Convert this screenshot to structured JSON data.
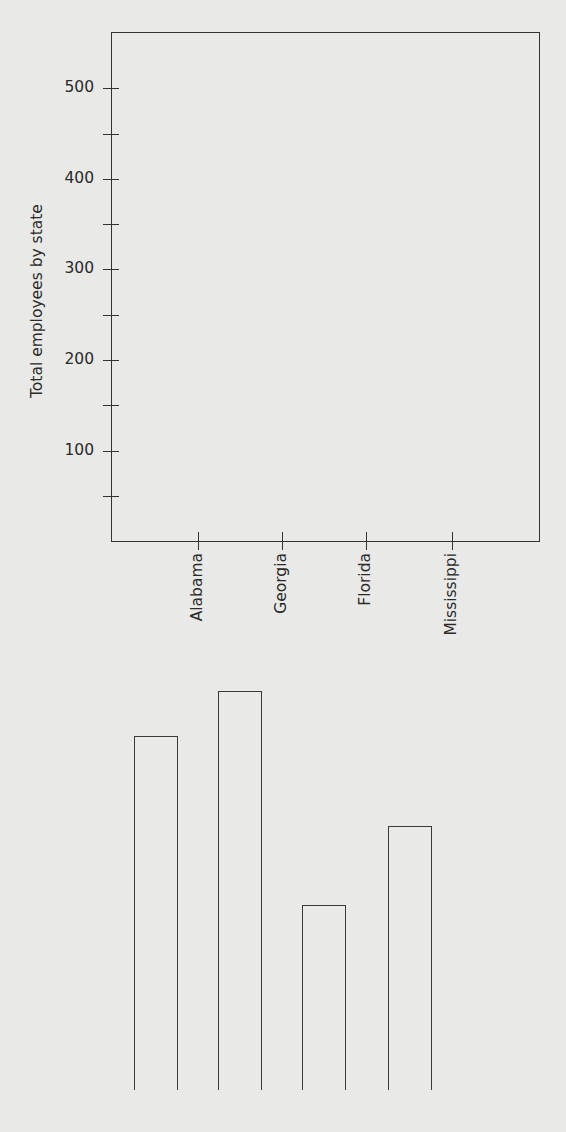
{
  "chart": {
    "ylabel": "Total employees by state",
    "yticks": [
      {
        "label": "500",
        "y": 88
      },
      {
        "label": "",
        "y": 134
      },
      {
        "label": "400",
        "y": 179
      },
      {
        "label": "",
        "y": 224
      },
      {
        "label": "300",
        "y": 269
      },
      {
        "label": "",
        "y": 315
      },
      {
        "label": "200",
        "y": 360
      },
      {
        "label": "",
        "y": 405
      },
      {
        "label": "100",
        "y": 451
      },
      {
        "label": "",
        "y": 496
      }
    ],
    "xticks": [
      {
        "label": "Alabama",
        "x": 198
      },
      {
        "label": "Georgia",
        "x": 282
      },
      {
        "label": "Florida",
        "x": 366
      },
      {
        "label": "Mississippi",
        "x": 452
      }
    ],
    "cutout_bars": [
      {
        "state": "Alabama",
        "left": 134,
        "top": 736,
        "width": 44
      },
      {
        "state": "Georgia",
        "left": 218,
        "top": 691,
        "width": 44
      },
      {
        "state": "Florida",
        "left": 302,
        "top": 905,
        "width": 44
      },
      {
        "state": "Mississippi",
        "left": 388,
        "top": 826,
        "width": 44
      }
    ]
  },
  "chart_data": {
    "type": "bar",
    "title": "",
    "xlabel": "",
    "ylabel": "Total employees by state",
    "categories": [
      "Alabama",
      "Georgia",
      "Florida",
      "Mississippi"
    ],
    "values": [
      390,
      440,
      205,
      290
    ],
    "ylim": [
      0,
      560
    ],
    "yticks": [
      100,
      200,
      300,
      400,
      500
    ],
    "minor_ytick_step": 50,
    "grid": false,
    "legend": null
  }
}
